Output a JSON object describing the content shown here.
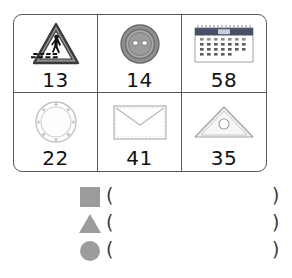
{
  "worksheet": {
    "table": {
      "rows": [
        [
          {
            "icon": "pedestrian-crossing-sign-icon",
            "label": "13"
          },
          {
            "icon": "button-icon",
            "label": "14"
          },
          {
            "icon": "calendar-icon",
            "label": "58"
          }
        ],
        [
          {
            "icon": "ring-icon",
            "label": "22"
          },
          {
            "icon": "envelope-icon",
            "label": "41"
          },
          {
            "icon": "triangle-ruler-icon",
            "label": "35"
          }
        ]
      ]
    },
    "answers": [
      {
        "shape": "square-shape-icon",
        "open": "(",
        "value": "",
        "close": ")"
      },
      {
        "shape": "triangle-shape-icon",
        "open": "(",
        "value": "",
        "close": ")"
      },
      {
        "shape": "circle-shape-icon",
        "open": "(",
        "value": "",
        "close": ")"
      }
    ],
    "colors": {
      "shape_gray": "#9c9c9c",
      "border_gray": "#5a5a5a",
      "text_black": "#121212",
      "calendar_header": "#3b4a6b"
    }
  }
}
